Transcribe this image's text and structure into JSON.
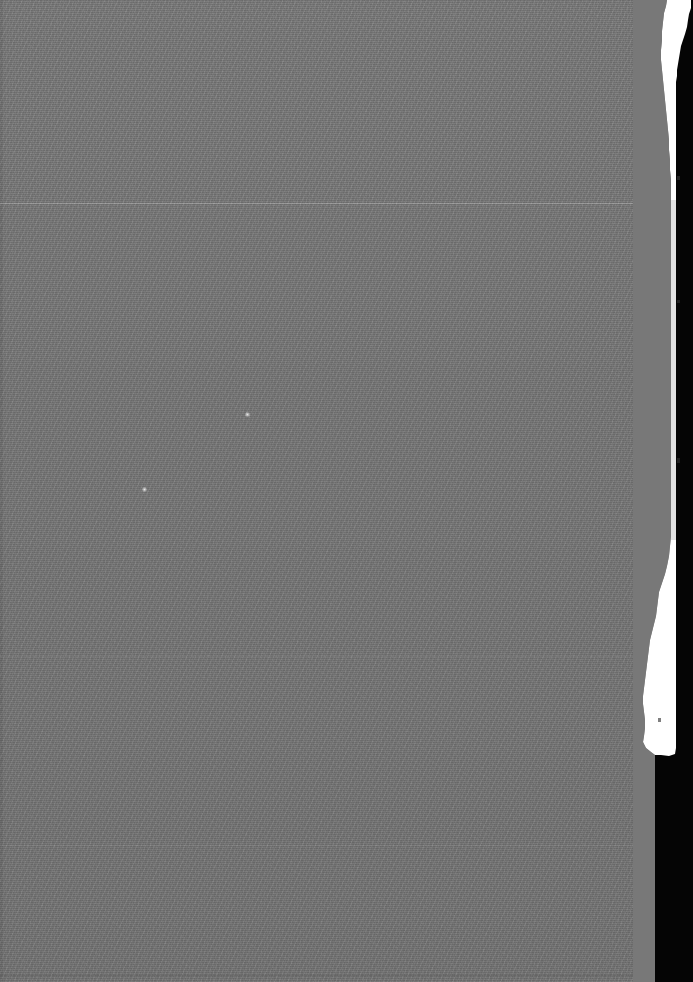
{
  "image": {
    "kind": "scanned-page-fragment",
    "width": 693,
    "height": 982,
    "description": "Blank mid-gray scanned page surface with ragged bright right-hand paper edge and black gutter",
    "caption": ""
  },
  "colors": {
    "page_gray": "#787878",
    "paper_edge_white": "#FFFFFF",
    "gutter_black": "#050505",
    "scanline_light": "#9A9A9A",
    "speck_white": "#ECECEC"
  },
  "regions": {
    "page_surface_label": "page-surface",
    "paper_edge_label": "paper-edge-highlight",
    "gutter_label": "scanner-gutter",
    "grain_label": "scan-grain"
  },
  "scanlines": [
    {
      "name": "scanline-upper",
      "y": 203,
      "intensity": "bright"
    },
    {
      "name": "scanline-mid",
      "y": 656,
      "intensity": "dim"
    },
    {
      "name": "scanline-lower",
      "y": 845,
      "intensity": "dim"
    },
    {
      "name": "scanline-bottom",
      "y": 975,
      "intensity": "dark"
    }
  ],
  "specks": [
    {
      "name": "speck-upper",
      "x": 247,
      "y": 414,
      "size": 4
    },
    {
      "name": "speck-lower",
      "x": 144,
      "y": 489,
      "size": 4
    }
  ],
  "paper_edge": {
    "top_width": 22,
    "min_width": 4,
    "bottom_flare_width": 20,
    "ends_at_y": 755
  },
  "gutter": {
    "left_x": 672,
    "width": 21
  }
}
